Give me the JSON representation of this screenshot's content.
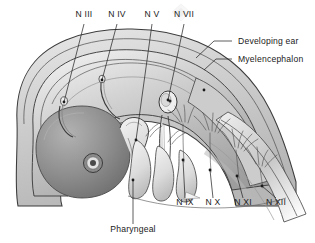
{
  "figure": {
    "background_color": "#ffffff",
    "line_color": "#2a2a2a",
    "text_color": "#1a1a1a"
  },
  "labels": {
    "top": [
      {
        "id": "n3",
        "text": "N III",
        "x": 84,
        "y": 17
      },
      {
        "id": "n4",
        "text": "N IV",
        "x": 117,
        "y": 17
      },
      {
        "id": "n5",
        "text": "N V",
        "x": 152,
        "y": 17
      },
      {
        "id": "n7",
        "text": "N VII",
        "x": 184,
        "y": 17
      }
    ],
    "right": [
      {
        "id": "developing-ear",
        "text": "Developing ear",
        "x": 238,
        "y": 44
      },
      {
        "id": "myelencephalon",
        "text": "Myelencephalon",
        "x": 238,
        "y": 62
      }
    ],
    "bottom_right": [
      {
        "id": "n9",
        "text": "N IX",
        "x": 185,
        "y": 205
      },
      {
        "id": "n10",
        "text": "N X",
        "x": 213,
        "y": 205
      },
      {
        "id": "n11",
        "text": "N XI",
        "x": 243,
        "y": 205
      },
      {
        "id": "n12",
        "text": "N XII",
        "x": 276,
        "y": 205
      }
    ],
    "bottom_center": [
      {
        "id": "pharyngeal",
        "text": "Pharyngeal",
        "x": 133,
        "y": 232
      }
    ]
  },
  "watermark": {
    "present": true,
    "x": 181,
    "y": 4
  }
}
